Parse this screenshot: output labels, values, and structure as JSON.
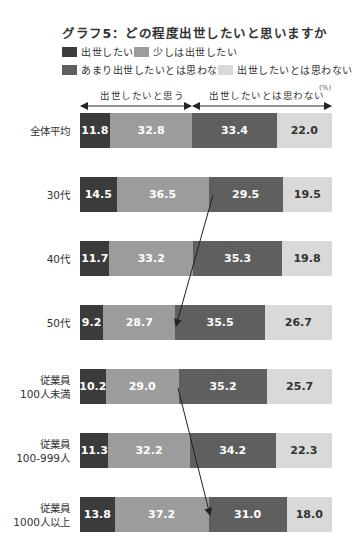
{
  "chart_data": {
    "type": "bar",
    "orientation": "horizontal",
    "stacked": true,
    "title": "グラフ5：どの程度出世したいと思いますか",
    "unit": "(%)",
    "group_labels": [
      "出世したいと思う",
      "出世したいとは思わない"
    ],
    "categories": [
      "全体平均",
      "30代",
      "40代",
      "50代",
      "従業員\n100人未満",
      "従業員\n100-999人",
      "従業員\n1000人以上"
    ],
    "category_lines": [
      [
        "全体平均"
      ],
      [
        "30代"
      ],
      [
        "40代"
      ],
      [
        "50代"
      ],
      [
        "従業員",
        "100人未満"
      ],
      [
        "従業員",
        "100-999人"
      ],
      [
        "従業員",
        "1000人以上"
      ]
    ],
    "series": [
      {
        "name": "出世したい",
        "color": "#3b3b3b",
        "values": [
          11.8,
          14.5,
          11.7,
          9.2,
          10.2,
          11.3,
          13.8
        ]
      },
      {
        "name": "少しは出世したい",
        "color": "#9c9c9c",
        "values": [
          32.8,
          36.5,
          33.2,
          28.7,
          29.0,
          32.2,
          37.2
        ]
      },
      {
        "name": "あまり出世したいとは思わない",
        "color": "#5f5f5f",
        "values": [
          33.4,
          29.5,
          35.3,
          35.5,
          35.2,
          34.2,
          31.0
        ]
      },
      {
        "name": "出世したいとは思わない",
        "color": "#d9d9d9",
        "values": [
          22.0,
          19.5,
          19.8,
          26.7,
          25.7,
          22.3,
          18.0
        ]
      }
    ],
    "annotations": [
      "arrow from 30代 boundary to 50代 boundary",
      "arrow from 100人未満 boundary to 1000人以上 boundary"
    ],
    "xlim": [
      0,
      100
    ],
    "legend_position": "top"
  }
}
